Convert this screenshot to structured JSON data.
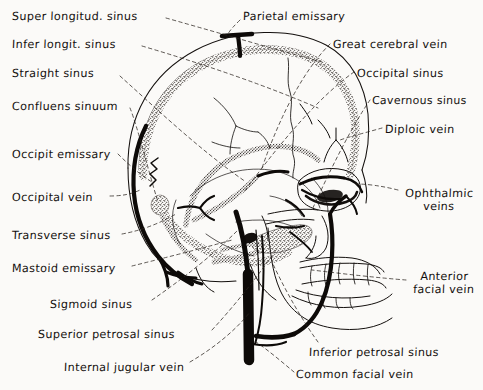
{
  "figure": {
    "kind": "anatomical-illustration",
    "style": "pen-and-ink line drawing with stippled sinus channels and handwritten labels",
    "background_color": "#fbfaf8",
    "ink_color": "#14100e",
    "leader_line_style": "dashed"
  },
  "labels": [
    {
      "id": "super-longitud-sinus",
      "text": "Super longitud. sinus",
      "x": 12,
      "y": 10,
      "anchor": "left"
    },
    {
      "id": "infer-longit-sinus",
      "text": "Infer longit. sinus",
      "x": 12,
      "y": 38,
      "anchor": "left"
    },
    {
      "id": "straight-sinus",
      "text": "Straight sinus",
      "x": 12,
      "y": 67,
      "anchor": "left"
    },
    {
      "id": "confluens-sinuum",
      "text": "Confluens sinuum",
      "x": 12,
      "y": 100,
      "anchor": "left"
    },
    {
      "id": "occipit-emissary",
      "text": "Occipit emissary",
      "x": 12,
      "y": 148,
      "anchor": "left"
    },
    {
      "id": "occipital-vein",
      "text": "Occipital vein",
      "x": 12,
      "y": 191,
      "anchor": "left"
    },
    {
      "id": "transverse-sinus",
      "text": "Transverse sinus",
      "x": 12,
      "y": 229,
      "anchor": "left"
    },
    {
      "id": "mastoid-emissary",
      "text": "Mastoid emissary",
      "x": 12,
      "y": 262,
      "anchor": "left"
    },
    {
      "id": "sigmoid-sinus",
      "text": "Sigmoid sinus",
      "x": 50,
      "y": 298,
      "anchor": "left"
    },
    {
      "id": "superior-petrosal-sinus",
      "text": "Superior petrosal sinus",
      "x": 38,
      "y": 328,
      "anchor": "left"
    },
    {
      "id": "internal-jugular-vein",
      "text": "Internal jugular vein",
      "x": 64,
      "y": 361,
      "anchor": "left"
    },
    {
      "id": "parietal-emissary",
      "text": "Parietal emissary",
      "x": 243,
      "y": 10,
      "anchor": "left"
    },
    {
      "id": "great-cerebral-vein",
      "text": "Great cerebral vein",
      "x": 333,
      "y": 38,
      "anchor": "left"
    },
    {
      "id": "occipital-sinus",
      "text": "Occipital sinus",
      "x": 357,
      "y": 67,
      "anchor": "left"
    },
    {
      "id": "cavernous-sinus",
      "text": "Cavernous sinus",
      "x": 372,
      "y": 95,
      "anchor": "left"
    },
    {
      "id": "diploic-vein",
      "text": "Diploic vein",
      "x": 385,
      "y": 123,
      "anchor": "left"
    },
    {
      "id": "ophthalmic-veins",
      "text": "Ophthalmic veins",
      "x": 402,
      "y": 188,
      "anchor": "left",
      "multiline": true,
      "width": 74
    },
    {
      "id": "anterior-facial-vein",
      "text": "Anterior facial vein",
      "x": 409,
      "y": 271,
      "anchor": "left",
      "multiline": true,
      "width": 70
    },
    {
      "id": "inferior-petrosal-sinus",
      "text": "Inferior petrosal sinus",
      "x": 309,
      "y": 346,
      "anchor": "left"
    },
    {
      "id": "common-facial-vein",
      "text": "Common facial vein",
      "x": 296,
      "y": 368,
      "anchor": "left"
    }
  ]
}
